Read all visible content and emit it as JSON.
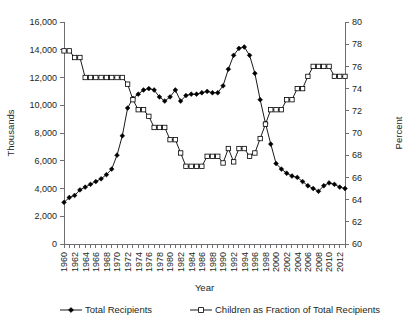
{
  "chart_data": {
    "type": "line",
    "title": "",
    "xlabel": "Year",
    "ylabel": "Thousands",
    "y2label": "Percent",
    "grid": false,
    "legend_position": "bottom",
    "xlim": [
      1960,
      2013
    ],
    "ylim": [
      0,
      16000
    ],
    "y2lim": [
      60,
      80
    ],
    "ytick_labels": [
      "0",
      "2,000",
      "4,000",
      "6,000",
      "8,000",
      "10,000",
      "12,000",
      "14,000",
      "16,000"
    ],
    "ytick_values": [
      0,
      2000,
      4000,
      6000,
      8000,
      10000,
      12000,
      14000,
      16000
    ],
    "y2tick_labels": [
      "60",
      "62",
      "64",
      "66",
      "68",
      "70",
      "72",
      "74",
      "76",
      "78",
      "80"
    ],
    "y2tick_values": [
      60,
      62,
      64,
      66,
      68,
      70,
      72,
      74,
      76,
      78,
      80
    ],
    "x": [
      1960,
      1961,
      1962,
      1963,
      1964,
      1965,
      1966,
      1967,
      1968,
      1969,
      1970,
      1971,
      1972,
      1973,
      1974,
      1975,
      1976,
      1977,
      1978,
      1979,
      1980,
      1981,
      1982,
      1983,
      1984,
      1985,
      1986,
      1987,
      1988,
      1989,
      1990,
      1991,
      1992,
      1993,
      1994,
      1995,
      1996,
      1997,
      1998,
      1999,
      2000,
      2001,
      2002,
      2003,
      2004,
      2005,
      2006,
      2007,
      2008,
      2009,
      2010,
      2011,
      2012,
      2013
    ],
    "xtick_labels": [
      "1960",
      "1962",
      "1964",
      "1966",
      "1968",
      "1970",
      "1972",
      "1974",
      "1976",
      "1978",
      "1980",
      "1982",
      "1984",
      "1986",
      "1988",
      "1990",
      "1992",
      "1994",
      "1996",
      "1998",
      "2000",
      "2002",
      "2004",
      "2006",
      "2008",
      "2010",
      "2012"
    ],
    "series": [
      {
        "name": "Total Recipients",
        "axis": "left",
        "marker": "filled-diamond",
        "units": "thousands",
        "values": [
          3005,
          3350,
          3500,
          3900,
          4100,
          4300,
          4500,
          4700,
          5000,
          5400,
          6400,
          7800,
          9800,
          10500,
          10800,
          11100,
          11200,
          11100,
          10600,
          10300,
          10600,
          11100,
          10300,
          10700,
          10800,
          10800,
          10900,
          11000,
          10900,
          10900,
          11400,
          12600,
          13600,
          14100,
          14200,
          13600,
          12300,
          10400,
          8700,
          7200,
          5800,
          5400,
          5100,
          4900,
          4800,
          4500,
          4200,
          4000,
          3800,
          4200,
          4400,
          4300,
          4100,
          4000
        ]
      },
      {
        "name": "Children as Fraction of Total Recipients",
        "axis": "right",
        "marker": "open-square",
        "units": "percent",
        "values": [
          77.4,
          77.4,
          76.8,
          76.8,
          75.0,
          75.0,
          75.0,
          75.0,
          75.0,
          75.0,
          75.0,
          75.0,
          74.4,
          73.0,
          72.1,
          72.1,
          71.5,
          70.5,
          70.5,
          70.5,
          69.4,
          69.4,
          68.2,
          67.0,
          67.0,
          67.0,
          67.0,
          67.9,
          67.9,
          67.9,
          67.3,
          68.6,
          67.4,
          68.6,
          68.6,
          67.9,
          68.2,
          69.5,
          70.8,
          72.1,
          72.1,
          72.1,
          73.0,
          73.0,
          74.0,
          74.0,
          75.1,
          76.0,
          76.0,
          76.0,
          76.0,
          75.1,
          75.1,
          75.1
        ]
      }
    ],
    "legend": [
      {
        "label": "Total Recipients",
        "marker": "filled-diamond"
      },
      {
        "label": "Children as Fraction of Total Recipients",
        "marker": "open-square"
      }
    ]
  }
}
